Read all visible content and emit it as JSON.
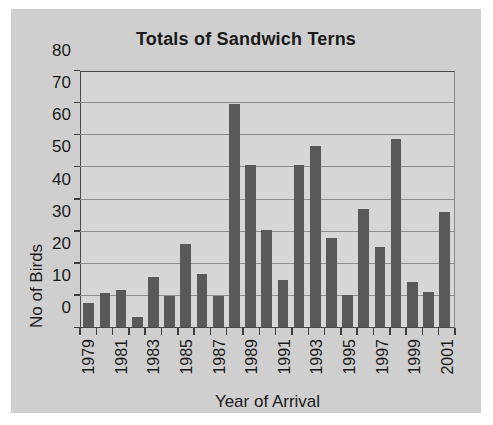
{
  "chart_data": {
    "type": "bar",
    "title": "Totals of Sandwich Terns",
    "xlabel": "Year of Arrival",
    "ylabel": "No of Birds",
    "ylim": [
      0,
      80
    ],
    "ytick_values": [
      0,
      10,
      20,
      30,
      40,
      50,
      60,
      70,
      80
    ],
    "ytick_labels": [
      "0",
      "10",
      "20",
      "30",
      "40",
      "50",
      "60",
      "70",
      "80"
    ],
    "grid": true,
    "legend": false,
    "bar_color": "#595959",
    "plot_background": "#d6d6d6",
    "panel_background": "#cfcfcf",
    "axis_color": "#3d3d3d",
    "gridline_color": "#8c8c8c",
    "categories": [
      "1979",
      "1980",
      "1981",
      "1982",
      "1983",
      "1984",
      "1985",
      "1986",
      "1987",
      "1988",
      "1989",
      "1990",
      "1991",
      "1992",
      "1993",
      "1994",
      "1995",
      "1996",
      "1997",
      "1998",
      "1999",
      "2000",
      "2001"
    ],
    "xtick_labels_shown": [
      "1979",
      "",
      "1981",
      "",
      "1983",
      "",
      "1985",
      "",
      "1987",
      "",
      "1989",
      "",
      "1991",
      "",
      "1993",
      "",
      "1995",
      "",
      "1997",
      "",
      "1999",
      "",
      "2001"
    ],
    "values": [
      7.5,
      10.5,
      11.5,
      3,
      15.5,
      9.5,
      26,
      16.5,
      9.5,
      70,
      51,
      30.5,
      14.5,
      51,
      57,
      28,
      10,
      37,
      25,
      59,
      14,
      11,
      36
    ]
  }
}
